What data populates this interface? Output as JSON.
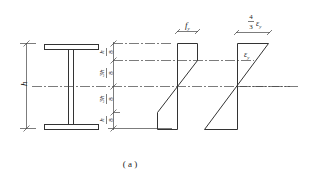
{
  "figure": {
    "caption": "( a )",
    "section": {
      "name": "I-section",
      "height_label": "h",
      "segments": [
        {
          "num": "h",
          "den": "8"
        },
        {
          "num": "3h",
          "den": "8"
        },
        {
          "num": "3h",
          "den": "8"
        },
        {
          "num": "h",
          "den": "8"
        }
      ]
    },
    "stress_diagram": {
      "label": "f",
      "label_sub": "y"
    },
    "strain_diagram": {
      "top_label_num": "4",
      "top_label_den": "3",
      "top_label_sym": "ε",
      "top_label_sub": "y",
      "inner_label_sym": "ε",
      "inner_label_sub": "y"
    }
  }
}
